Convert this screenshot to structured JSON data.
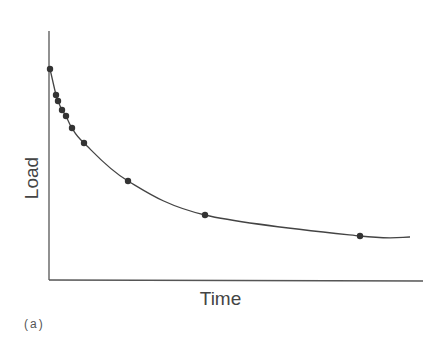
{
  "chart_data": {
    "type": "line",
    "title": "",
    "xlabel": "Time",
    "ylabel": "Load",
    "panel_label": "(a)",
    "grid": false,
    "legend": null,
    "ticks": false,
    "series": [
      {
        "name": "Load",
        "points_px": [
          [
            50,
            69
          ],
          [
            56,
            95
          ],
          [
            58,
            101
          ],
          [
            62,
            110
          ],
          [
            66,
            116
          ],
          [
            72,
            128
          ],
          [
            84,
            143
          ],
          [
            128,
            181
          ],
          [
            205,
            215
          ],
          [
            360,
            236
          ]
        ],
        "x_rel": [
          0.0,
          0.016,
          0.022,
          0.032,
          0.043,
          0.059,
          0.091,
          0.208,
          0.414,
          0.827
        ],
        "y_rel": [
          0.85,
          0.74,
          0.72,
          0.68,
          0.66,
          0.61,
          0.55,
          0.4,
          0.26,
          0.18
        ]
      }
    ],
    "curve_end_px": [
      410,
      237
    ],
    "axes_px": {
      "origin": [
        49,
        280
      ],
      "x_end": 423,
      "y_top": 31
    }
  }
}
